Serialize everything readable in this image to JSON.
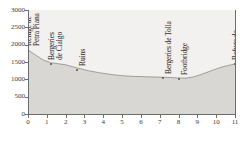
{
  "chart_data": {
    "type": "area",
    "title": "",
    "xlabel": "",
    "ylabel": "",
    "xlim": [
      0,
      11
    ],
    "ylim": [
      0,
      3000
    ],
    "grid": true,
    "legend": "none",
    "x_ticks": [
      "0",
      "1",
      "2",
      "3",
      "4",
      "5",
      "6",
      "7",
      "8",
      "9",
      "10",
      "11"
    ],
    "y_ticks": [
      "0",
      "500",
      "1000",
      "1500",
      "2000",
      "2500",
      "3000"
    ],
    "series": [
      {
        "name": "Elevation profile",
        "x": [
          0,
          0.4,
          0.8,
          1.2,
          1.6,
          2.0,
          2.6,
          3.2,
          3.8,
          4.4,
          5.0,
          5.6,
          6.2,
          6.8,
          7.2,
          7.6,
          8.0,
          8.4,
          8.8,
          9.2,
          9.6,
          10.0,
          10.4,
          10.8,
          11.0
        ],
        "values": [
          1850,
          1700,
          1560,
          1480,
          1450,
          1420,
          1330,
          1250,
          1190,
          1140,
          1105,
          1085,
          1075,
          1065,
          1060,
          1050,
          1040,
          1035,
          1070,
          1140,
          1220,
          1300,
          1370,
          1420,
          1445
        ]
      }
    ],
    "background_bands": [
      {
        "from": 0,
        "to": 500,
        "color": "#b9b7b3"
      },
      {
        "from": 500,
        "to": 1000,
        "color": "#c9c7c3"
      },
      {
        "from": 1000,
        "to": 3000,
        "color": "#f2f1ef"
      }
    ],
    "gridlines_y": [
      500,
      1000
    ],
    "terrain_fill": "#d9d7d3",
    "terrain_line": "#8e8c88",
    "annotations": [
      {
        "label": "Refuge de Petra Piana",
        "x": 0.0,
        "y": 1850,
        "marker": false,
        "lines": [
          "Refuge de",
          "Petra Piana"
        ]
      },
      {
        "label": "Bergeries de Cialgo",
        "x": 1.2,
        "y": 1455,
        "marker": true,
        "lines": [
          "Bergeries",
          "de Cialgo"
        ]
      },
      {
        "label": "Ruins",
        "x": 2.6,
        "y": 1255,
        "marker": true,
        "lines": [
          "Ruins"
        ]
      },
      {
        "label": "Bergeries de Tolla",
        "x": 7.2,
        "y": 1030,
        "marker": true,
        "lines": [
          "Bergeries de Tolla"
        ]
      },
      {
        "label": "Footbridge",
        "x": 8.0,
        "y": 1020,
        "marker": true,
        "lines": [
          "Footbridge"
        ]
      },
      {
        "label": "Refuge de l'Onda",
        "x": 11.0,
        "y": 1440,
        "marker": true,
        "lines": [
          "Refuge de",
          "l'Onda"
        ]
      }
    ]
  }
}
